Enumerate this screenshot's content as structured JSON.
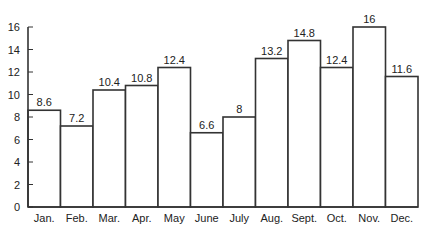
{
  "chart_data": {
    "type": "bar",
    "title": "",
    "xlabel": "",
    "ylabel": "",
    "categories": [
      "Jan.",
      "Feb.",
      "Mar.",
      "Apr.",
      "May",
      "June",
      "July",
      "Aug.",
      "Sept.",
      "Oct.",
      "Nov.",
      "Dec."
    ],
    "values": [
      8.6,
      7.2,
      10.4,
      10.8,
      12.4,
      6.6,
      8,
      13.2,
      14.8,
      12.4,
      16,
      11.6
    ],
    "data_labels": [
      "8.6",
      "7.2",
      "10.4",
      "10.8",
      "12.4",
      "6.6",
      "8",
      "13.2",
      "14.8",
      "12.4",
      "16",
      "11.6"
    ],
    "yticks": [
      0,
      2,
      4,
      6,
      8,
      10,
      12,
      14,
      16
    ],
    "ylim": [
      0,
      16
    ],
    "grid": false,
    "legend": null,
    "bar_fill": "#ffffff",
    "bar_stroke": "#333333"
  }
}
